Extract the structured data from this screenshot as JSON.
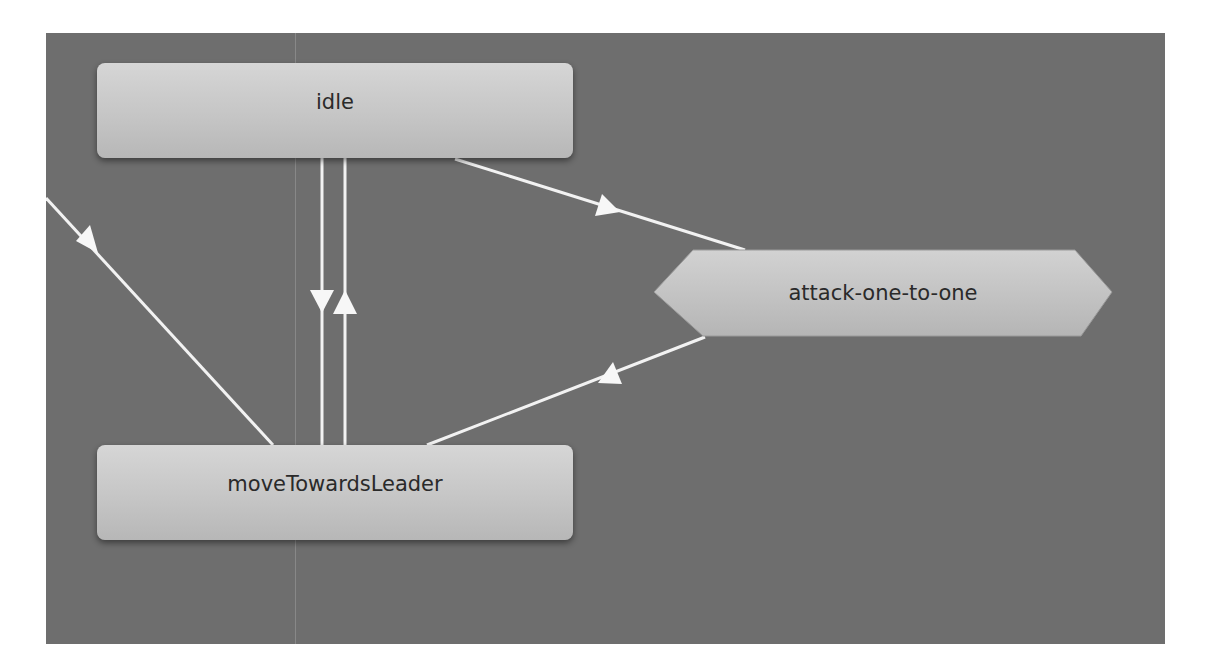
{
  "diagram": {
    "type": "state-machine",
    "background_color": "#6e6e6e",
    "edge_color": "#f2f2f2",
    "nodes": [
      {
        "id": "idle",
        "label": "idle",
        "shape": "rounded-rect"
      },
      {
        "id": "attack",
        "label": "attack-one-to-one",
        "shape": "hexagon"
      },
      {
        "id": "move",
        "label": "moveTowardsLeader",
        "shape": "rounded-rect"
      }
    ],
    "edges": [
      {
        "from": "offscreen-left",
        "to": "moveTowardsLeader"
      },
      {
        "from": "idle",
        "to": "moveTowardsLeader"
      },
      {
        "from": "moveTowardsLeader",
        "to": "idle"
      },
      {
        "from": "idle",
        "to": "attack-one-to-one"
      },
      {
        "from": "attack-one-to-one",
        "to": "moveTowardsLeader"
      }
    ]
  }
}
